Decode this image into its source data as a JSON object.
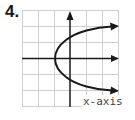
{
  "problem": {
    "number": "4."
  },
  "graph": {
    "axis_label": "x-axis",
    "grid_color": "#cfcfcf",
    "axis_color": "#1a1a1a",
    "curve_color": "#1a1a1a",
    "curve_description": "Parabola opening right, vertex at (-1, 0), arrows pointing right on both branches",
    "vertex": [
      -1,
      0
    ]
  }
}
